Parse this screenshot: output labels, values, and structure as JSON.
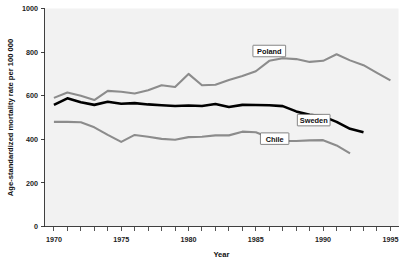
{
  "chart_data": {
    "type": "line",
    "title": "",
    "subtitle": "",
    "xlabel": "Year",
    "ylabel": "Age-standardized mortality rate per 100 000",
    "xlim": [
      1969.3,
      1995.6
    ],
    "ylim": [
      0,
      1000
    ],
    "grid": false,
    "legend_position": "inline-labels",
    "y_ticks": [
      0,
      200,
      400,
      600,
      800,
      1000
    ],
    "y_tick_labels": [
      "0",
      "200",
      "400",
      "600",
      "800",
      "1000"
    ],
    "x_ticks": [
      1970,
      1975,
      1980,
      1985,
      1990,
      1995
    ],
    "x_tick_labels": [
      "1970",
      "1975",
      "1980",
      "1985",
      "1990",
      "1995"
    ],
    "x_minor_ticks": [
      1970,
      1971,
      1972,
      1973,
      1974,
      1975,
      1976,
      1977,
      1978,
      1979,
      1980,
      1981,
      1982,
      1983,
      1984,
      1985,
      1986,
      1987,
      1988,
      1989,
      1990,
      1991,
      1992,
      1993,
      1994,
      1995
    ],
    "plot_background": "#f2f2f2",
    "page_background": "#ffffff",
    "series": [
      {
        "name": "Poland",
        "color": "#8c8c8c",
        "stroke_width": 2.1,
        "label_x": 1986.0,
        "label_y": 805,
        "x": [
          1970,
          1971,
          1972,
          1973,
          1974,
          1975,
          1976,
          1977,
          1978,
          1979,
          1980,
          1981,
          1982,
          1983,
          1984,
          1985,
          1986,
          1987,
          1988,
          1989,
          1990,
          1991,
          1992,
          1993,
          1994,
          1995
        ],
        "values": [
          590,
          615,
          600,
          580,
          622,
          618,
          610,
          625,
          648,
          640,
          700,
          648,
          650,
          672,
          690,
          712,
          760,
          772,
          768,
          755,
          760,
          790,
          762,
          740,
          705,
          670
        ]
      },
      {
        "name": "Sweden",
        "color": "#000000",
        "stroke_width": 2.6,
        "label_x": 1989.3,
        "label_y": 488,
        "x": [
          1970,
          1971,
          1972,
          1973,
          1974,
          1975,
          1976,
          1977,
          1978,
          1979,
          1980,
          1981,
          1982,
          1983,
          1984,
          1985,
          1986,
          1987,
          1988,
          1989,
          1990,
          1991,
          1992,
          1993
        ],
        "values": [
          558,
          588,
          570,
          558,
          572,
          563,
          566,
          560,
          556,
          553,
          555,
          553,
          562,
          548,
          558,
          557,
          556,
          552,
          528,
          512,
          505,
          480,
          448,
          432
        ]
      },
      {
        "name": "Chile",
        "color": "#8c8c8c",
        "stroke_width": 2.1,
        "label_x": 1986.4,
        "label_y": 403,
        "x": [
          1970,
          1971,
          1972,
          1973,
          1974,
          1975,
          1976,
          1977,
          1978,
          1979,
          1980,
          1981,
          1982,
          1983,
          1984,
          1985,
          1986,
          1987,
          1988,
          1989,
          1990,
          1991,
          1992
        ],
        "values": [
          480,
          480,
          478,
          455,
          420,
          388,
          420,
          412,
          402,
          398,
          410,
          412,
          418,
          418,
          435,
          432,
          408,
          392,
          392,
          395,
          396,
          372,
          335
        ]
      }
    ]
  }
}
